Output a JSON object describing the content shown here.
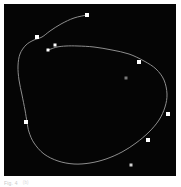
{
  "figure": {
    "panel_background": "#050505",
    "page_background": "#ffffff",
    "caption": "Fig. 4",
    "caption_note": "(b)",
    "curve_color": "#8d8d8d",
    "marker_color": "#ffffff",
    "dim_marker_color": "#7a7a7a"
  },
  "chart_data": {
    "type": "scatter",
    "title": "",
    "subtitle": "",
    "xlabel": "",
    "ylabel": "",
    "xlim": [
      0,
      172
    ],
    "ylim": [
      0,
      172
    ],
    "grid": false,
    "legend": "none",
    "axis_visible": false,
    "series": [
      {
        "name": "path-curve",
        "type": "line",
        "color": "#8d8d8d",
        "linewidth": 1,
        "closed": false,
        "path_points": [
          [
            83,
            11
          ],
          [
            70,
            14
          ],
          [
            57,
            20
          ],
          [
            46,
            27
          ],
          [
            38,
            33
          ],
          [
            30,
            36
          ],
          [
            22,
            41
          ],
          [
            16,
            50
          ],
          [
            14,
            62
          ],
          [
            15,
            76
          ],
          [
            18,
            91
          ],
          [
            21,
            106
          ],
          [
            23,
            118
          ],
          [
            25,
            128
          ],
          [
            30,
            139
          ],
          [
            40,
            150
          ],
          [
            54,
            157
          ],
          [
            70,
            160
          ],
          [
            86,
            159
          ],
          [
            102,
            155
          ],
          [
            118,
            148
          ],
          [
            132,
            139
          ],
          [
            145,
            128
          ],
          [
            155,
            116
          ],
          [
            161,
            103
          ],
          [
            163,
            90
          ],
          [
            160,
            76
          ],
          [
            152,
            65
          ],
          [
            140,
            57
          ],
          [
            125,
            50
          ],
          [
            108,
            46
          ],
          [
            90,
            43
          ],
          [
            74,
            42
          ],
          [
            62,
            42
          ],
          [
            53,
            43
          ],
          [
            47,
            45
          ],
          [
            44,
            46
          ]
        ]
      },
      {
        "name": "waypoints",
        "type": "scatter",
        "color": "#ffffff",
        "marker": "square",
        "points": [
          {
            "label": "p1",
            "x": 83,
            "y": 11,
            "size": 4,
            "color": "#ffffff"
          },
          {
            "label": "p2",
            "x": 33,
            "y": 33,
            "size": 4,
            "color": "#ffffff"
          },
          {
            "label": "p3",
            "x": 51,
            "y": 41,
            "size": 3,
            "color": "#ffffff"
          },
          {
            "label": "p4",
            "x": 44,
            "y": 46,
            "size": 3,
            "color": "#ffffff"
          },
          {
            "label": "p5",
            "x": 135,
            "y": 58,
            "size": 4,
            "color": "#ffffff"
          },
          {
            "label": "p6",
            "x": 122,
            "y": 74,
            "size": 3,
            "color": "#7a7a7a"
          },
          {
            "label": "p7",
            "x": 164,
            "y": 110,
            "size": 4,
            "color": "#ffffff"
          },
          {
            "label": "p8",
            "x": 22,
            "y": 118,
            "size": 4,
            "color": "#ffffff"
          },
          {
            "label": "p9",
            "x": 144,
            "y": 136,
            "size": 4,
            "color": "#ffffff"
          },
          {
            "label": "p10",
            "x": 127,
            "y": 161,
            "size": 3,
            "color": "#cfcfcf"
          }
        ]
      }
    ]
  }
}
